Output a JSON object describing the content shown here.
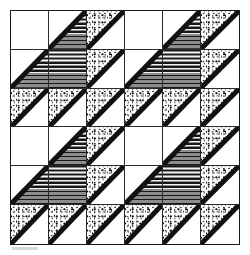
{
  "figure": {
    "grid_columns": 6,
    "grid_rows": 6,
    "motif_columns": 3,
    "motif_rows": 3,
    "frame_color": "#1a1a1a",
    "grid_line_color": "#2b2b2b",
    "background_color": "#ffffff"
  },
  "legend": {
    "fills": [
      {
        "key": "blank",
        "label": "Blank / background",
        "color": "#ffffff"
      },
      {
        "key": "hatch",
        "label": "Shaded horizontal hatch",
        "color": "#8d8d8d"
      },
      {
        "key": "dots",
        "label": "Stippled dots",
        "color": "#111111"
      }
    ],
    "shapes": [
      {
        "key": "full",
        "label": "Full square"
      },
      {
        "key": "lower-right",
        "label": "Lower-right triangle"
      },
      {
        "key": "upper-left",
        "label": "Upper-left triangle"
      },
      {
        "key": "none",
        "label": "Empty"
      }
    ]
  },
  "chart_data": {
    "type": "heatmap",
    "xlabel": "",
    "ylabel": "",
    "categories": [
      "c0",
      "c1",
      "c2",
      "c3",
      "c4",
      "c5"
    ],
    "rows": [
      "r0",
      "r1",
      "r2",
      "r3",
      "r4",
      "r5"
    ],
    "motif": [
      [
        {
          "fill": "blank",
          "shape": "none",
          "diagonal": false
        },
        {
          "fill": "hatch",
          "shape": "lower-right",
          "diagonal": true
        },
        {
          "fill": "dots",
          "shape": "upper-left",
          "diagonal": true
        }
      ],
      [
        {
          "fill": "hatch",
          "shape": "lower-right",
          "diagonal": true
        },
        {
          "fill": "hatch",
          "shape": "full",
          "diagonal": false
        },
        {
          "fill": "dots",
          "shape": "upper-left",
          "diagonal": true
        }
      ],
      [
        {
          "fill": "dots",
          "shape": "upper-left",
          "diagonal": true
        },
        {
          "fill": "dots",
          "shape": "upper-left",
          "diagonal": true
        },
        {
          "fill": "dots",
          "shape": "upper-left",
          "diagonal": true
        }
      ]
    ],
    "cells": [
      [
        {
          "fill": "blank",
          "shape": "none",
          "diagonal": false
        },
        {
          "fill": "hatch",
          "shape": "lower-right",
          "diagonal": true
        },
        {
          "fill": "dots",
          "shape": "upper-left",
          "diagonal": true
        },
        {
          "fill": "blank",
          "shape": "none",
          "diagonal": false
        },
        {
          "fill": "hatch",
          "shape": "lower-right",
          "diagonal": true
        },
        {
          "fill": "dots",
          "shape": "upper-left",
          "diagonal": true
        }
      ],
      [
        {
          "fill": "hatch",
          "shape": "lower-right",
          "diagonal": true
        },
        {
          "fill": "hatch",
          "shape": "full",
          "diagonal": false
        },
        {
          "fill": "dots",
          "shape": "upper-left",
          "diagonal": true
        },
        {
          "fill": "hatch",
          "shape": "lower-right",
          "diagonal": true
        },
        {
          "fill": "hatch",
          "shape": "full",
          "diagonal": false
        },
        {
          "fill": "dots",
          "shape": "upper-left",
          "diagonal": true
        }
      ],
      [
        {
          "fill": "dots",
          "shape": "upper-left",
          "diagonal": true
        },
        {
          "fill": "dots",
          "shape": "upper-left",
          "diagonal": true
        },
        {
          "fill": "dots",
          "shape": "upper-left",
          "diagonal": true
        },
        {
          "fill": "dots",
          "shape": "upper-left",
          "diagonal": true
        },
        {
          "fill": "dots",
          "shape": "upper-left",
          "diagonal": true
        },
        {
          "fill": "dots",
          "shape": "upper-left",
          "diagonal": true
        }
      ],
      [
        {
          "fill": "blank",
          "shape": "none",
          "diagonal": false
        },
        {
          "fill": "hatch",
          "shape": "lower-right",
          "diagonal": true
        },
        {
          "fill": "dots",
          "shape": "upper-left",
          "diagonal": true
        },
        {
          "fill": "blank",
          "shape": "none",
          "diagonal": false
        },
        {
          "fill": "hatch",
          "shape": "lower-right",
          "diagonal": true
        },
        {
          "fill": "dots",
          "shape": "upper-left",
          "diagonal": true
        }
      ],
      [
        {
          "fill": "hatch",
          "shape": "lower-right",
          "diagonal": true
        },
        {
          "fill": "hatch",
          "shape": "full",
          "diagonal": false
        },
        {
          "fill": "dots",
          "shape": "upper-left",
          "diagonal": true
        },
        {
          "fill": "hatch",
          "shape": "lower-right",
          "diagonal": true
        },
        {
          "fill": "hatch",
          "shape": "full",
          "diagonal": false
        },
        {
          "fill": "dots",
          "shape": "upper-left",
          "diagonal": true
        }
      ],
      [
        {
          "fill": "dots",
          "shape": "upper-left",
          "diagonal": true
        },
        {
          "fill": "dots",
          "shape": "upper-left",
          "diagonal": true
        },
        {
          "fill": "dots",
          "shape": "upper-left",
          "diagonal": true
        },
        {
          "fill": "dots",
          "shape": "upper-left",
          "diagonal": true
        },
        {
          "fill": "dots",
          "shape": "upper-left",
          "diagonal": true
        },
        {
          "fill": "dots",
          "shape": "upper-left",
          "diagonal": true
        }
      ]
    ]
  }
}
